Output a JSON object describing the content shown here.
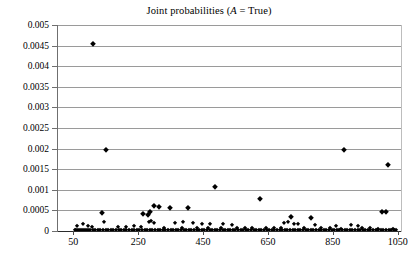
{
  "chart": {
    "title_prefix": "Joint probabilities (",
    "title_italic": "A",
    "title_suffix": " = True)",
    "title_full": "Joint probabilities (A = True)"
  },
  "axes": {
    "y_tick_labels": [
      "0.005",
      "0.0045",
      "0.004",
      "0.0035",
      "0.003",
      "0.0025",
      "0.002",
      "0.0015",
      "0.001",
      "0.0005",
      "0"
    ],
    "x_tick_labels": [
      "50",
      "250",
      "450",
      "650",
      "850",
      "1050"
    ]
  },
  "colors": {
    "marker": "#000000",
    "gridline": "#9a9a9a",
    "axis": "#2b2b2b",
    "background": "#ffffff"
  },
  "chart_data": {
    "type": "scatter",
    "title": "Joint probabilities (A = True)",
    "xlabel": "",
    "ylabel": "",
    "xlim": [
      0,
      1060
    ],
    "ylim": [
      0,
      0.005
    ],
    "grid": true,
    "legend": false,
    "marker": "diamond",
    "y_ticks": [
      0,
      0.0005,
      0.001,
      0.0015,
      0.002,
      0.0025,
      0.003,
      0.0035,
      0.004,
      0.0045,
      0.005
    ],
    "x_ticks": [
      50,
      250,
      450,
      650,
      850,
      1050
    ],
    "series": [
      {
        "name": "joint probability",
        "points": [
          [
            112,
            0.00455
          ],
          [
            151,
            0.00196
          ],
          [
            883,
            0.00197
          ],
          [
            1020,
            0.00161
          ],
          [
            486,
            0.00107
          ],
          [
            627,
            0.00077
          ],
          [
            298,
            0.0006
          ],
          [
            315,
            0.00058
          ],
          [
            349,
            0.00056
          ],
          [
            405,
            0.00057
          ],
          [
            286,
            0.00046
          ],
          [
            266,
            0.00042
          ],
          [
            140,
            0.00044
          ],
          [
            279,
            0.0004
          ],
          [
            1001,
            0.00046
          ],
          [
            1014,
            0.00046
          ],
          [
            722,
            0.00034
          ],
          [
            783,
            0.00032
          ],
          [
            144,
            0.00022
          ],
          [
            283,
            0.00021
          ],
          [
            290,
            0.00024
          ],
          [
            300,
            0.0002
          ],
          [
            365,
            0.0002
          ],
          [
            389,
            0.00021
          ],
          [
            420,
            0.00019
          ],
          [
            447,
            0.00018
          ],
          [
            470,
            0.00017
          ],
          [
            512,
            0.00017
          ],
          [
            540,
            0.00015
          ],
          [
            700,
            0.00019
          ],
          [
            712,
            0.00022
          ],
          [
            730,
            0.00017
          ],
          [
            742,
            0.00016
          ],
          [
            795,
            0.00014
          ],
          [
            860,
            0.00013
          ],
          [
            905,
            0.00015
          ],
          [
            927,
            0.00013
          ],
          [
            62,
            0.00013
          ],
          [
            80,
            0.00016
          ],
          [
            95,
            0.00011
          ],
          [
            108,
            0.0001
          ],
          [
            188,
            9e-05
          ],
          [
            212,
            0.0001
          ],
          [
            238,
            0.00011
          ],
          [
            258,
            9e-05
          ],
          [
            330,
            8e-05
          ],
          [
            386,
            8e-05
          ],
          [
            430,
            8e-05
          ],
          [
            465,
            7e-05
          ],
          [
            505,
            7e-05
          ],
          [
            555,
            8e-05
          ],
          [
            580,
            7e-05
          ],
          [
            600,
            7e-05
          ],
          [
            645,
            8e-05
          ],
          [
            668,
            7e-05
          ],
          [
            690,
            8e-05
          ],
          [
            760,
            7e-05
          ],
          [
            812,
            7e-05
          ],
          [
            840,
            8e-05
          ],
          [
            875,
            6e-05
          ],
          [
            940,
            7e-05
          ],
          [
            965,
            7e-05
          ],
          [
            990,
            6e-05
          ],
          [
            1035,
            6e-05
          ],
          [
            55,
            3e-05
          ],
          [
            60,
            2e-05
          ],
          [
            66,
            3e-05
          ],
          [
            72,
            2e-05
          ],
          [
            78,
            3e-05
          ],
          [
            84,
            2e-05
          ],
          [
            90,
            3e-05
          ],
          [
            96,
            2e-05
          ],
          [
            102,
            3e-05
          ],
          [
            110,
            2e-05
          ],
          [
            118,
            3e-05
          ],
          [
            126,
            2e-05
          ],
          [
            134,
            3e-05
          ],
          [
            142,
            2e-05
          ],
          [
            150,
            3e-05
          ],
          [
            158,
            2e-05
          ],
          [
            166,
            3e-05
          ],
          [
            174,
            2e-05
          ],
          [
            182,
            3e-05
          ],
          [
            190,
            2e-05
          ],
          [
            198,
            3e-05
          ],
          [
            206,
            2e-05
          ],
          [
            214,
            3e-05
          ],
          [
            222,
            2e-05
          ],
          [
            230,
            3e-05
          ],
          [
            238,
            2e-05
          ],
          [
            246,
            3e-05
          ],
          [
            254,
            2e-05
          ],
          [
            262,
            3e-05
          ],
          [
            270,
            2e-05
          ],
          [
            278,
            3e-05
          ],
          [
            286,
            2e-05
          ],
          [
            294,
            3e-05
          ],
          [
            302,
            2e-05
          ],
          [
            310,
            3e-05
          ],
          [
            318,
            2e-05
          ],
          [
            326,
            3e-05
          ],
          [
            334,
            2e-05
          ],
          [
            342,
            3e-05
          ],
          [
            350,
            2e-05
          ],
          [
            358,
            3e-05
          ],
          [
            366,
            2e-05
          ],
          [
            374,
            3e-05
          ],
          [
            382,
            2e-05
          ],
          [
            390,
            3e-05
          ],
          [
            398,
            2e-05
          ],
          [
            406,
            3e-05
          ],
          [
            414,
            2e-05
          ],
          [
            422,
            3e-05
          ],
          [
            430,
            2e-05
          ],
          [
            438,
            3e-05
          ],
          [
            446,
            2e-05
          ],
          [
            454,
            3e-05
          ],
          [
            462,
            2e-05
          ],
          [
            470,
            3e-05
          ],
          [
            478,
            2e-05
          ],
          [
            486,
            3e-05
          ],
          [
            494,
            2e-05
          ],
          [
            502,
            3e-05
          ],
          [
            510,
            2e-05
          ],
          [
            518,
            3e-05
          ],
          [
            526,
            2e-05
          ],
          [
            534,
            3e-05
          ],
          [
            542,
            2e-05
          ],
          [
            550,
            3e-05
          ],
          [
            558,
            2e-05
          ],
          [
            566,
            3e-05
          ],
          [
            574,
            2e-05
          ],
          [
            582,
            3e-05
          ],
          [
            590,
            2e-05
          ],
          [
            598,
            3e-05
          ],
          [
            606,
            2e-05
          ],
          [
            614,
            3e-05
          ],
          [
            622,
            2e-05
          ],
          [
            630,
            3e-05
          ],
          [
            638,
            2e-05
          ],
          [
            646,
            3e-05
          ],
          [
            654,
            2e-05
          ],
          [
            662,
            3e-05
          ],
          [
            670,
            2e-05
          ],
          [
            678,
            3e-05
          ],
          [
            686,
            2e-05
          ],
          [
            694,
            3e-05
          ],
          [
            702,
            2e-05
          ],
          [
            710,
            3e-05
          ],
          [
            718,
            2e-05
          ],
          [
            726,
            3e-05
          ],
          [
            734,
            2e-05
          ],
          [
            742,
            3e-05
          ],
          [
            750,
            2e-05
          ],
          [
            758,
            3e-05
          ],
          [
            766,
            2e-05
          ],
          [
            774,
            3e-05
          ],
          [
            782,
            2e-05
          ],
          [
            790,
            3e-05
          ],
          [
            798,
            2e-05
          ],
          [
            806,
            3e-05
          ],
          [
            814,
            2e-05
          ],
          [
            822,
            3e-05
          ],
          [
            830,
            2e-05
          ],
          [
            838,
            3e-05
          ],
          [
            846,
            2e-05
          ],
          [
            854,
            3e-05
          ],
          [
            862,
            2e-05
          ],
          [
            870,
            3e-05
          ],
          [
            878,
            2e-05
          ],
          [
            886,
            3e-05
          ],
          [
            894,
            2e-05
          ],
          [
            902,
            3e-05
          ],
          [
            910,
            2e-05
          ],
          [
            918,
            3e-05
          ],
          [
            926,
            2e-05
          ],
          [
            934,
            3e-05
          ],
          [
            942,
            2e-05
          ],
          [
            950,
            3e-05
          ],
          [
            958,
            2e-05
          ],
          [
            966,
            3e-05
          ],
          [
            974,
            2e-05
          ],
          [
            982,
            3e-05
          ],
          [
            990,
            2e-05
          ],
          [
            998,
            3e-05
          ],
          [
            1006,
            2e-05
          ],
          [
            1014,
            3e-05
          ],
          [
            1022,
            2e-05
          ],
          [
            1030,
            3e-05
          ],
          [
            1038,
            2e-05
          ],
          [
            1046,
            3e-05
          ]
        ]
      }
    ]
  }
}
